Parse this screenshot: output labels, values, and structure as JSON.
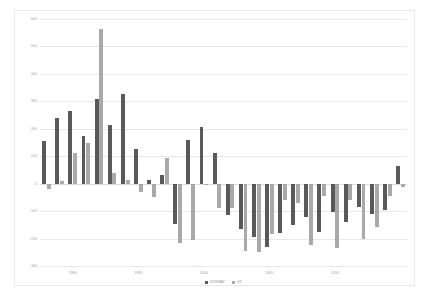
{
  "chart_data": {
    "type": "bar",
    "title": "",
    "xlabel": "",
    "ylabel": "",
    "ylim": [
      -300,
      600
    ],
    "ystep": 100,
    "yticks": [
      "600",
      "500",
      "400",
      "300",
      "200",
      "100",
      "0",
      "-100",
      "-200",
      "-300"
    ],
    "grid": true,
    "legend_position": "bottom",
    "categories": [
      "1988",
      "1989",
      "1990",
      "1991",
      "1992",
      "1993",
      "1994",
      "1995",
      "1996",
      "1997",
      "1998",
      "1999",
      "2000",
      "2001",
      "2002",
      "2003",
      "2004",
      "2005",
      "2006",
      "2007",
      "2008",
      "2009",
      "2010",
      "2011",
      "2012",
      "2013",
      "2014",
      "2015"
    ],
    "xtick_labels": [
      "1990",
      "1995",
      "2000",
      "2005",
      "2010"
    ],
    "xtick_categories": [
      "1990",
      "1995",
      "2000",
      "2005",
      "2010"
    ],
    "series": [
      {
        "name": "NORWAY",
        "color": "#595959",
        "values": [
          155,
          238,
          265,
          172,
          310,
          212,
          325,
          128,
          15,
          30,
          -148,
          160,
          205,
          110,
          -115,
          -165,
          -195,
          -230,
          -180,
          -150,
          -120,
          -175,
          -105,
          -138,
          -85,
          -110,
          -95,
          65
        ]
      },
      {
        "name": "UK",
        "color": "#a9a9a9",
        "values": [
          -18,
          8,
          112,
          150,
          565,
          38,
          12,
          -30,
          -48,
          95,
          -215,
          -205,
          -5,
          -90,
          -88,
          -245,
          -250,
          -185,
          -60,
          -70,
          -225,
          -45,
          -235,
          -60,
          -200,
          -158,
          -45,
          -12
        ]
      }
    ]
  }
}
